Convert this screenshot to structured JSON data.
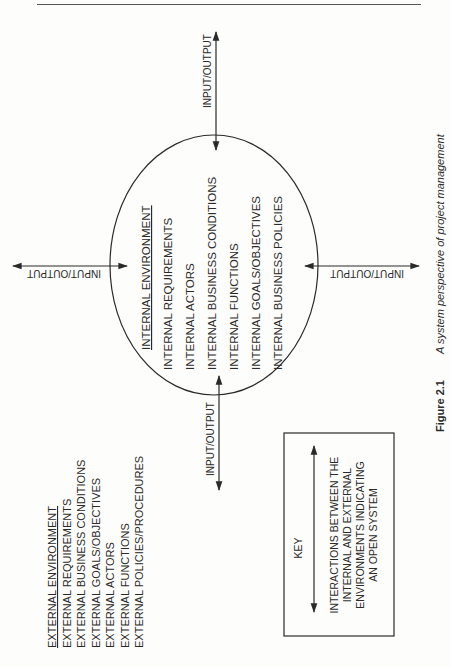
{
  "page": {
    "header_rule": true
  },
  "external": {
    "title": "EXTERNAL ENVIRONMENT",
    "items": [
      "EXTERNAL REQUIREMENTS",
      "EXTERNAL BUSINESS CONDITIONS",
      "EXTERNAL GOALS/OBJECTIVES",
      "EXTERNAL ACTORS",
      "EXTERNAL FUNCTIONS",
      "EXTERNAL POLICIES/PROCEDURES"
    ]
  },
  "internal": {
    "title": "INTERNAL ENVIRONMENT",
    "items": [
      "INTERNAL REQUIREMENTS",
      "INTERNAL ACTORS",
      "INTERNAL BUSINESS CONDITIONS",
      "INTERNAL FUNCTIONS",
      "INTERNAL GOALS/OBJECTIVES",
      "INTERNAL BUSINESS POLICIES"
    ]
  },
  "arrows": {
    "top_label": "INPUT/OUTPUT",
    "bottom_label": "INPUT/OUTPUT",
    "left_label": "INPUT/OUTPUT",
    "right_label": "INPUT/OUTPUT"
  },
  "key": {
    "title": "KEY",
    "lines": [
      "INTERACTIONS BETWEEN THE",
      "INTERNAL AND EXTERNAL",
      "ENVIRONMENTS INDICATING",
      "AN OPEN SYSTEM"
    ]
  },
  "caption": {
    "label": "Figure 2.1",
    "text": "A system perspective of project management"
  },
  "colors": {
    "ink": "#2a2a2a",
    "paper": "#fdfdfb"
  }
}
